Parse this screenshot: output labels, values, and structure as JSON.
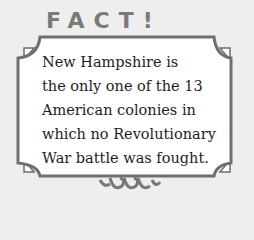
{
  "card": {
    "heading": "FACT!",
    "lines": [
      "New Hampshire is",
      "the only one of the 13",
      "American colonies in",
      "which no Revolutionary",
      "War battle was fought."
    ],
    "colors": {
      "background": "#eeeeee",
      "panel": "#ffffff",
      "border": "#6f6f6f",
      "heading": "#7a7a7a",
      "text": "#1e1e1e"
    }
  }
}
